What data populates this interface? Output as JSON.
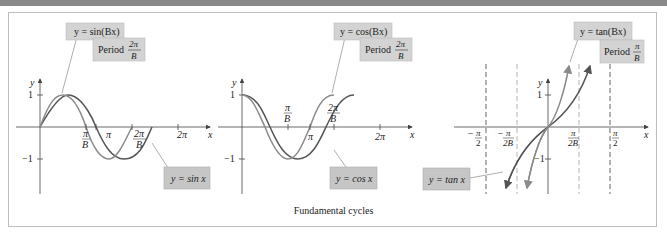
{
  "figure": {
    "caption": "Fundamental cycles",
    "colors": {
      "curve_dark": "#555555",
      "curve_light": "#8a8a8a",
      "label_box": "#cfcfcf",
      "axis": "#444444",
      "asymptote_dark": "#555555",
      "asymptote_light": "#aaaaaa",
      "topbar": "#8a8a8a"
    },
    "panels": [
      {
        "name": "sine",
        "labels": {
          "func_B": "y = sin(Bx)",
          "period_word": "Period",
          "period_num": "2π",
          "period_den": "B",
          "func_base": "y = sin x"
        },
        "axis": {
          "x": "x",
          "y": "y"
        },
        "yticks": [
          "1",
          "−1"
        ],
        "xticks": [
          {
            "num": "π",
            "den": "B"
          },
          {
            "num": "π",
            "den": ""
          },
          {
            "num": "2π",
            "den": "B"
          },
          {
            "num": "2π",
            "den": ""
          }
        ]
      },
      {
        "name": "cosine",
        "labels": {
          "func_B": "y = cos(Bx)",
          "period_word": "Period",
          "period_num": "2π",
          "period_den": "B",
          "func_base": "y = cos x"
        },
        "axis": {
          "x": "x",
          "y": "y"
        },
        "yticks": [
          "1",
          "−1"
        ],
        "xticks": [
          {
            "num": "π",
            "den": "B"
          },
          {
            "num": "π",
            "den": ""
          },
          {
            "num": "2π",
            "den": "B"
          },
          {
            "num": "2π",
            "den": ""
          }
        ]
      },
      {
        "name": "tangent",
        "labels": {
          "func_B": "y = tan(Bx)",
          "period_word": "Period",
          "period_num": "π",
          "period_den": "B",
          "func_base": "y = tan x"
        },
        "axis": {
          "x": "x",
          "y": "y"
        },
        "yticks": [
          "1",
          "−1"
        ],
        "xticks": [
          {
            "num": "π",
            "den": "2",
            "sign": "−"
          },
          {
            "num": "π",
            "den": "2B",
            "sign": "−"
          },
          {
            "num": "π",
            "den": "2B",
            "sign": ""
          },
          {
            "num": "π",
            "den": "2",
            "sign": ""
          }
        ]
      }
    ]
  }
}
